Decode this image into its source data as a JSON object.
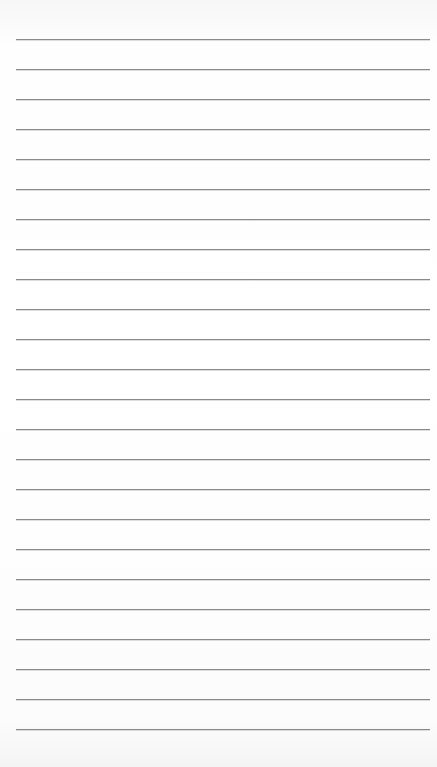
{
  "page": {
    "type": "lined-paper",
    "background_color": "#ffffff",
    "line_color": "#8a8a8a",
    "line_count": 24,
    "first_line_y": 39,
    "line_spacing": 30,
    "line_left": 16,
    "line_width": 414
  }
}
